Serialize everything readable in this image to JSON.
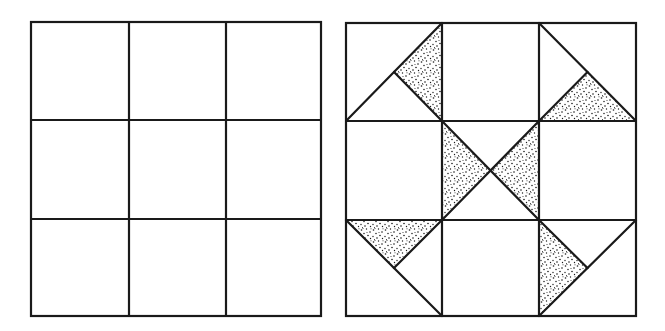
{
  "figure": {
    "type": "quilt-block-diagram",
    "panels": [
      {
        "id": "blank-grid",
        "description": "Empty 3x3 nine-patch grid",
        "grid": {
          "rows": 3,
          "cols": 3
        },
        "bounds": {
          "x": 31,
          "y": 22,
          "w": 290,
          "h": 294
        },
        "col_lines_x": [
          31,
          129,
          226,
          321
        ],
        "row_lines_y": [
          22,
          120,
          219,
          316
        ]
      },
      {
        "id": "quilt-block",
        "description": "3x3 nine-patch quilt block with half-square and quarter-square triangle units; stippled triangles form a pinwheel/X pattern",
        "grid": {
          "rows": 3,
          "cols": 3
        },
        "bounds": {
          "x": 346,
          "y": 23,
          "w": 290,
          "h": 293
        },
        "col_lines_x": [
          346,
          442,
          539,
          636
        ],
        "row_lines_y": [
          23,
          121,
          220,
          316
        ],
        "cells": [
          {
            "row": 0,
            "col": 0,
            "lines": [
              [
                [
                  0,
                  1
                ],
                [
                  1,
                  0
                ]
              ],
              [
                [
                  0.5,
                  0.5
                ],
                [
                  1,
                  1
                ]
              ]
            ],
            "shaded": [
              [
                [
                  0.5,
                  0.5
                ],
                [
                  1,
                  0
                ],
                [
                  1,
                  1
                ]
              ]
            ]
          },
          {
            "row": 0,
            "col": 1,
            "lines": [],
            "shaded": []
          },
          {
            "row": 0,
            "col": 2,
            "lines": [
              [
                [
                  2,
                  0
                ],
                [
                  3,
                  1
                ]
              ],
              [
                [
                  2.5,
                  0.5
                ],
                [
                  2,
                  1
                ]
              ]
            ],
            "shaded": [
              [
                [
                  2,
                  1
                ],
                [
                  2.5,
                  0.5
                ],
                [
                  3,
                  1
                ]
              ]
            ]
          },
          {
            "row": 1,
            "col": 0,
            "lines": [],
            "shaded": []
          },
          {
            "row": 1,
            "col": 1,
            "lines": [
              [
                [
                  1,
                  1
                ],
                [
                  2,
                  2
                ]
              ],
              [
                [
                  2,
                  1
                ],
                [
                  1,
                  2
                ]
              ]
            ],
            "shaded": [
              [
                [
                  1,
                  1
                ],
                [
                  1.5,
                  1.5
                ],
                [
                  1,
                  2
                ]
              ],
              [
                [
                  2,
                  1
                ],
                [
                  1.5,
                  1.5
                ],
                [
                  2,
                  2
                ]
              ]
            ]
          },
          {
            "row": 1,
            "col": 2,
            "lines": [],
            "shaded": []
          },
          {
            "row": 2,
            "col": 0,
            "lines": [
              [
                [
                  0,
                  2
                ],
                [
                  1,
                  3
                ]
              ],
              [
                [
                  0.5,
                  2.5
                ],
                [
                  1,
                  2
                ]
              ]
            ],
            "shaded": [
              [
                [
                  0,
                  2
                ],
                [
                  1,
                  2
                ],
                [
                  0.5,
                  2.5
                ]
              ]
            ]
          },
          {
            "row": 2,
            "col": 1,
            "lines": [],
            "shaded": []
          },
          {
            "row": 2,
            "col": 2,
            "lines": [
              [
                [
                  2,
                  3
                ],
                [
                  3,
                  2
                ]
              ],
              [
                [
                  2.5,
                  2.5
                ],
                [
                  2,
                  2
                ]
              ]
            ],
            "shaded": [
              [
                [
                  2,
                  2
                ],
                [
                  2.5,
                  2.5
                ],
                [
                  2,
                  3
                ]
              ]
            ]
          }
        ]
      }
    ],
    "colors": {
      "background": "#ffffff",
      "ink": "#1a1a1a",
      "stipple": "#1a1a1a"
    },
    "fill_pattern": "stipple-dots"
  }
}
